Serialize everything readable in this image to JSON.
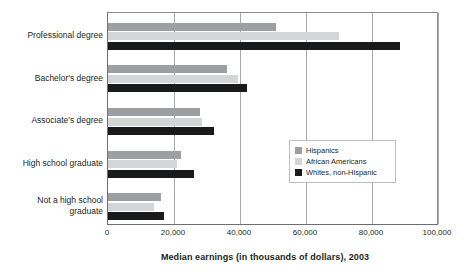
{
  "chart_data": {
    "type": "bar",
    "orientation": "horizontal",
    "title": "",
    "xlabel": "Median earnings (in thousands of dollars), 2003",
    "ylabel": "",
    "xlim": [
      0,
      100000
    ],
    "xticks": [
      0,
      20000,
      40000,
      60000,
      80000,
      100000
    ],
    "xtick_labels": [
      "0",
      "20,000",
      "40,000",
      "60,000",
      "80,000",
      "100,000"
    ],
    "grid": true,
    "grid_axis": "x",
    "legend_position": "center-right",
    "categories": [
      "Professional degree",
      "Bachelor's degree",
      "Associate's degree",
      "High school graduate",
      "Not a high school\ngraduate"
    ],
    "series": [
      {
        "name": "Hispanics",
        "color": "#9d9fa2",
        "values": [
          51000,
          36000,
          28000,
          22000,
          16000
        ]
      },
      {
        "name": "African Americans",
        "color": "#d4d5d7",
        "values": [
          70000,
          39500,
          28500,
          21000,
          14000
        ]
      },
      {
        "name": "Whites, non-Hispanic",
        "color": "#1a1a1a",
        "values": [
          88500,
          42000,
          32000,
          26000,
          17000
        ]
      }
    ]
  },
  "legend": {
    "items": [
      {
        "label": "Hispanics",
        "color": "#9d9fa2"
      },
      {
        "label": "African Americans",
        "color": "#d4d5d7"
      },
      {
        "label": "Whites, non-Hispanic",
        "color": "#1a1a1a"
      }
    ]
  },
  "axis": {
    "title": "Median earnings (in thousands of dollars), 2003"
  }
}
